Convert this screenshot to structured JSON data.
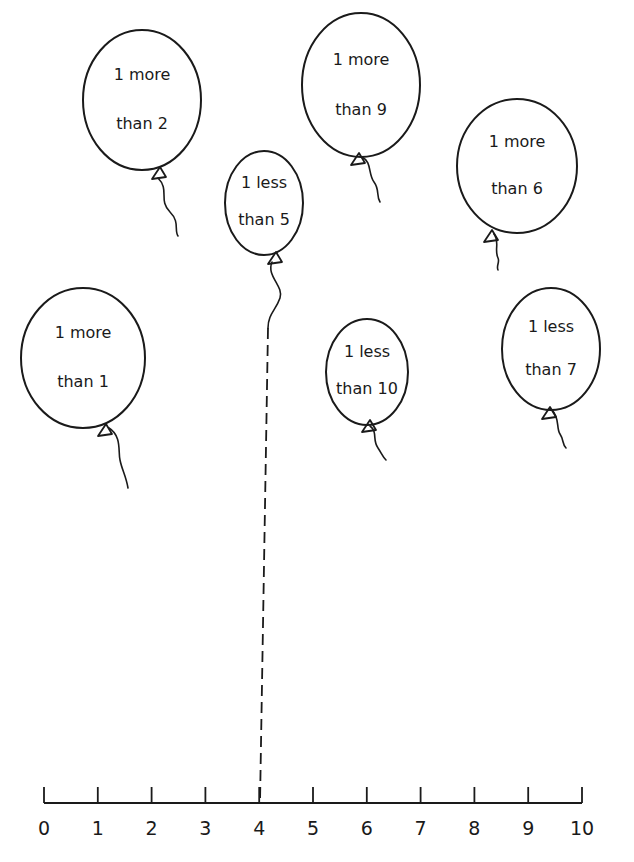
{
  "worksheet": {
    "balloons": [
      {
        "id": "b1",
        "line1": "1 more",
        "line2": "than 2",
        "cx": 142,
        "cy": 100,
        "rx": 59,
        "ry": 70,
        "knot": [
          158,
          173
        ],
        "string": "M158,178 C170,190 158,200 170,212 C180,222 174,230 178,236"
      },
      {
        "id": "b2",
        "line1": "1 less",
        "line2": "than 5",
        "cx": 264,
        "cy": 203,
        "rx": 39,
        "ry": 52,
        "knot": [
          274,
          258
        ],
        "string": "M272,262 C266,276 284,286 280,298 C276,310 268,314 268,328"
      },
      {
        "id": "b3",
        "line1": "1 more",
        "line2": "than 9",
        "cx": 361,
        "cy": 85,
        "rx": 59,
        "ry": 72,
        "knot": [
          357,
          159
        ],
        "string": "M362,157 C372,162 368,174 374,182 C380,190 376,196 380,202"
      },
      {
        "id": "b4",
        "line1": "1 more",
        "line2": "than 6",
        "cx": 517,
        "cy": 166,
        "rx": 60,
        "ry": 67,
        "knot": [
          490,
          236
        ],
        "string": "M494,234 C500,242 494,250 498,258 C500,262 496,266 498,270"
      },
      {
        "id": "b5",
        "line1": "1 more",
        "line2": "than 1",
        "cx": 83,
        "cy": 358,
        "rx": 62,
        "ry": 70,
        "knot": [
          104,
          430
        ],
        "string": "M109,428 C122,436 118,452 120,460 C122,470 126,476 128,488"
      },
      {
        "id": "b6",
        "line1": "1 less",
        "line2": "than 10",
        "cx": 367,
        "cy": 372,
        "rx": 41,
        "ry": 53,
        "knot": [
          368,
          426
        ],
        "string": "M370,426 C378,432 372,440 378,448 C382,454 382,456 386,460"
      },
      {
        "id": "b7",
        "line1": "1 less",
        "line2": "than 7",
        "cx": 551,
        "cy": 349,
        "rx": 49,
        "ry": 61,
        "knot": [
          548,
          413
        ],
        "string": "M552,410 C560,418 556,428 560,434 C564,440 562,444 566,448"
      }
    ],
    "dashed_connector": {
      "from_balloon": "b2",
      "to_value": "4",
      "x1": 268,
      "y1": 328,
      "x2": 260,
      "y2": 803
    },
    "number_line": {
      "y": 803,
      "x_start": 44,
      "x_end": 582,
      "tick_top": 787,
      "labels": [
        "0",
        "1",
        "2",
        "3",
        "4",
        "5",
        "6",
        "7",
        "8",
        "9",
        "10"
      ]
    },
    "colors": {
      "ink": "#1a1a1a",
      "paper": "#ffffff"
    }
  }
}
